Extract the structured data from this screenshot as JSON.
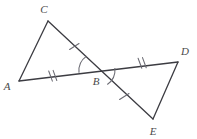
{
  "figure": {
    "canvas": {
      "width": 197,
      "height": 139
    },
    "stroke_color": "#3c3c42",
    "tick_color": "#6b6b73",
    "arc_color": "#6b6b73",
    "label_color": "#4a4a4a",
    "background": "#ffffff",
    "stroke_width": 1.3
  },
  "points": {
    "A": {
      "label": "A",
      "x": 19,
      "y": 81,
      "label_x": 7,
      "label_y": 86
    },
    "B": {
      "label": "B",
      "x": 97,
      "y": 70,
      "label_x": 96,
      "label_y": 81
    },
    "C": {
      "label": "C",
      "x": 48,
      "y": 21,
      "label_x": 44,
      "label_y": 9
    },
    "D": {
      "label": "D",
      "x": 178,
      "y": 62,
      "label_x": 185,
      "label_y": 51
    },
    "E": {
      "label": "E",
      "x": 153,
      "y": 119,
      "label_x": 153,
      "label_y": 131
    }
  },
  "segments": [
    {
      "name": "segment-AC",
      "from": "A",
      "to": "C",
      "ticks": 0
    },
    {
      "name": "segment-CE",
      "from": "C",
      "to": "E",
      "ticks": 0
    },
    {
      "name": "segment-AD",
      "from": "A",
      "to": "D",
      "ticks": 0
    },
    {
      "name": "segment-DE",
      "from": "D",
      "to": "E",
      "ticks": 0
    }
  ],
  "tick_marks": [
    {
      "name": "tick-AB-double",
      "on": "segment-AB",
      "count": 2,
      "x": 53,
      "y": 76
    },
    {
      "name": "tick-BD-double",
      "on": "segment-BD",
      "count": 2,
      "x": 142,
      "y": 63
    },
    {
      "name": "tick-CB-single",
      "on": "segment-CB",
      "count": 1,
      "x": 74,
      "y": 46
    },
    {
      "name": "tick-BE-single",
      "on": "segment-BE",
      "count": 1,
      "x": 124,
      "y": 96
    }
  ],
  "angle_arcs": [
    {
      "name": "angle-arc-ABC",
      "vertex": "B",
      "label": "angle ABC"
    },
    {
      "name": "angle-arc-DBE",
      "vertex": "B",
      "label": "angle DBE"
    }
  ]
}
